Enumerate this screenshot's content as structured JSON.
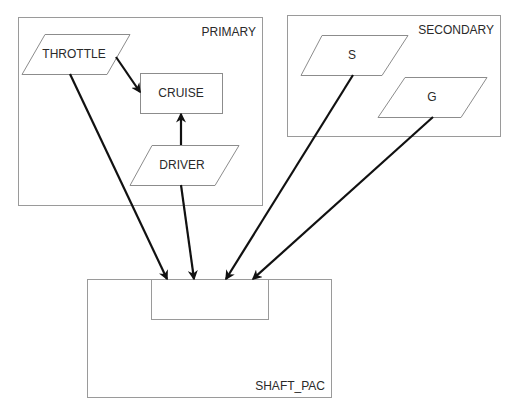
{
  "diagram": {
    "packages": [
      {
        "id": "primary",
        "label": "PRIMARY"
      },
      {
        "id": "secondary",
        "label": "SECONDARY"
      },
      {
        "id": "shaft_pac",
        "label": "SHAFT_PAC"
      }
    ],
    "nodes": [
      {
        "id": "throttle",
        "label": "THROTTLE",
        "shape": "parallelogram",
        "package": "primary"
      },
      {
        "id": "cruise",
        "label": "CRUISE",
        "shape": "rectangle",
        "package": "primary"
      },
      {
        "id": "driver",
        "label": "DRIVER",
        "shape": "parallelogram",
        "package": "primary"
      },
      {
        "id": "s",
        "label": "S",
        "shape": "parallelogram",
        "package": "secondary"
      },
      {
        "id": "g",
        "label": "G",
        "shape": "parallelogram",
        "package": "secondary"
      },
      {
        "id": "shaft_inner",
        "label": "",
        "shape": "rectangle",
        "package": "shaft_pac"
      }
    ],
    "edges": [
      {
        "from": "throttle",
        "to": "cruise"
      },
      {
        "from": "driver",
        "to": "cruise"
      },
      {
        "from": "throttle",
        "to": "shaft_inner"
      },
      {
        "from": "driver",
        "to": "shaft_inner"
      },
      {
        "from": "s",
        "to": "shaft_inner"
      },
      {
        "from": "g",
        "to": "shaft_inner"
      }
    ]
  },
  "labels": {
    "primary": "PRIMARY",
    "secondary": "SECONDARY",
    "shaft_pac": "SHAFT_PAC",
    "throttle": "THROTTLE",
    "cruise": "CRUISE",
    "driver": "DRIVER",
    "s": "S",
    "g": "G"
  },
  "colors": {
    "background": "#ffffff",
    "box_stroke": "#9a9a9a",
    "arrow": "#111111",
    "text": "#2a2a2a"
  }
}
